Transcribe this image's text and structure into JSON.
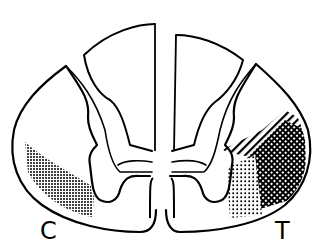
{
  "figure": {
    "labels": {
      "left": "C",
      "right": "T"
    },
    "colors": {
      "ink": "#000000",
      "background": "#ffffff"
    },
    "regions": [
      {
        "side": "left",
        "pattern": "stipple-dots",
        "location": "ventrolateral white matter"
      },
      {
        "side": "right",
        "pattern": "diagonal-hatch",
        "location": "lateral white matter"
      },
      {
        "side": "right",
        "pattern": "cross-hatch-dense",
        "location": "ventrolateral white matter"
      },
      {
        "side": "right",
        "pattern": "stipple-dots",
        "location": "ventral white matter"
      }
    ]
  }
}
